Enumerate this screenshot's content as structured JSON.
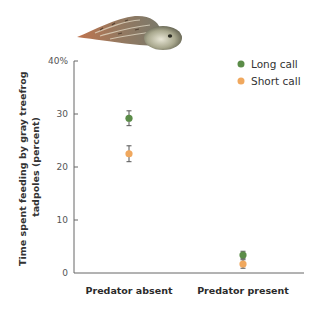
{
  "chart_data": {
    "type": "scatter",
    "title": "",
    "xlabel": "",
    "ylabel": "Time spent feeding by gray treefrog tadpoles (percent)",
    "ylabel_lines": [
      "Time spent feeding by gray treefrog",
      "tadpoles (percent)"
    ],
    "categories": [
      "Predator absent",
      "Predator present"
    ],
    "ylim": [
      0,
      40
    ],
    "yticks": [
      {
        "value": 0,
        "label": "0"
      },
      {
        "value": 10,
        "label": "10"
      },
      {
        "value": 20,
        "label": "20"
      },
      {
        "value": 30,
        "label": "30"
      },
      {
        "value": 40,
        "label": "40%"
      }
    ],
    "grid": false,
    "legend_position": "top-right",
    "series": [
      {
        "name": "Long call",
        "color": "#5b8c48",
        "values": [
          29.2,
          3.4
        ],
        "error": [
          1.4,
          0.7
        ]
      },
      {
        "name": "Short call",
        "color": "#f0a85e",
        "values": [
          22.5,
          1.7
        ],
        "error": [
          1.5,
          0.8
        ]
      }
    ],
    "illustration": "gray treefrog tadpole"
  },
  "legend": {
    "items": [
      {
        "label": "Long call",
        "color": "#5b8c48"
      },
      {
        "label": "Short call",
        "color": "#f0a85e"
      }
    ]
  }
}
